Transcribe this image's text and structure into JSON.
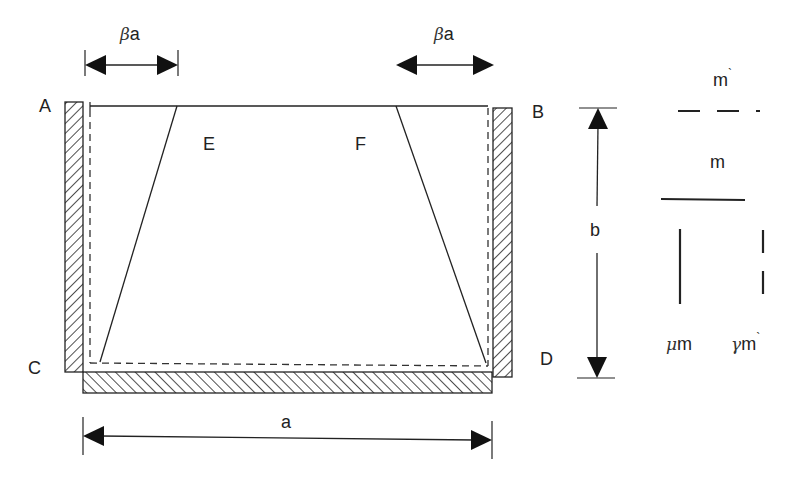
{
  "diagram": {
    "type": "plate-boundary-yield-line",
    "corners": {
      "A": "A",
      "B": "B",
      "C": "C",
      "D": "D"
    },
    "regions": {
      "E": "E",
      "F": "F"
    },
    "dimensions": {
      "width": "a",
      "height": "b",
      "left_offset": {
        "greek": "β",
        "var": "a"
      },
      "right_offset": {
        "greek": "β",
        "var": "a"
      }
    },
    "legend": {
      "negative_moment_h": {
        "label": "m",
        "prime": "`"
      },
      "positive_moment_h": {
        "label": "m"
      },
      "positive_moment_v": {
        "greek": "μ",
        "label": "m"
      },
      "negative_moment_v": {
        "greek": "γ",
        "label": "m",
        "prime": "`"
      }
    },
    "colors": {
      "line": "#222222",
      "hatch": "#222222",
      "background": "#ffffff"
    }
  }
}
